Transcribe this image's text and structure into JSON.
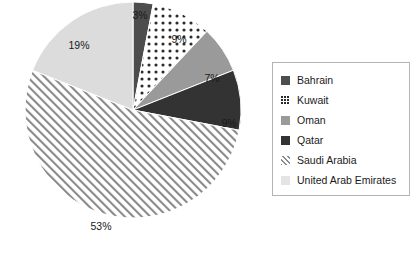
{
  "chart_data": {
    "type": "pie",
    "title": "",
    "xlabel": "",
    "ylabel": "",
    "value_suffix": "%",
    "legend_position": "right",
    "grid": false,
    "start_angle_deg": 0,
    "direction": "clockwise",
    "categories": [
      "Bahrain",
      "Kuwait",
      "Oman",
      "Qatar",
      "Saudi Arabia",
      "United Arab Emirates"
    ],
    "values": [
      3,
      9,
      7,
      9,
      53,
      19
    ],
    "slices": [
      {
        "label": "Bahrain",
        "value": 3,
        "display": "3%",
        "fill_kind": "solid",
        "color": "#4d4d4d",
        "label_x": 140,
        "label_y": 16
      },
      {
        "label": "Kuwait",
        "value": 9,
        "display": "9%",
        "fill_kind": "dots",
        "color": "#2b2b2b",
        "label_x": 179,
        "label_y": 40
      },
      {
        "label": "Oman",
        "value": 7,
        "display": "7%",
        "fill_kind": "solid",
        "color": "#9a9a9a",
        "label_x": 212,
        "label_y": 79
      },
      {
        "label": "Qatar",
        "value": 9,
        "display": "9%",
        "fill_kind": "solid",
        "color": "#333333",
        "label_x": 229,
        "label_y": 124
      },
      {
        "label": "Saudi Arabia",
        "value": 53,
        "display": "53%",
        "fill_kind": "hatch",
        "color": "#767676",
        "label_x": 101,
        "label_y": 227
      },
      {
        "label": "United Arab Emirates",
        "value": 19,
        "display": "19%",
        "fill_kind": "solid",
        "color": "#dcdcdc",
        "label_x": 79,
        "label_y": 46
      }
    ],
    "geometry": {
      "center_x": 133,
      "center_y": 110,
      "radius": 108
    }
  },
  "legend": {
    "items": [
      {
        "label": "Bahrain",
        "fill_kind": "solid",
        "color": "#4d4d4d"
      },
      {
        "label": "Kuwait",
        "fill_kind": "dots",
        "color": "#2b2b2b"
      },
      {
        "label": "Oman",
        "fill_kind": "solid",
        "color": "#9a9a9a"
      },
      {
        "label": "Qatar",
        "fill_kind": "solid",
        "color": "#333333"
      },
      {
        "label": "Saudi Arabia",
        "fill_kind": "hatch",
        "color": "#767676"
      },
      {
        "label": "United Arab Emirates",
        "fill_kind": "solid",
        "color": "#e4e4e4"
      }
    ]
  }
}
